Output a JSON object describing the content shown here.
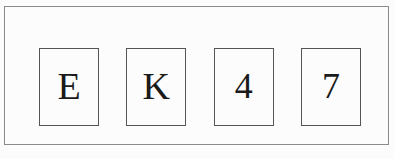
{
  "widget": {
    "name": "captcha-character-boxes",
    "background_color": "#fcfcfc",
    "frame_color": "#8a8a8a",
    "box_border_color": "#555555",
    "glyph_color": "#1a1a1a",
    "code": "EK47"
  },
  "characters": [
    {
      "value": "E",
      "kind": "letter"
    },
    {
      "value": "K",
      "kind": "letter"
    },
    {
      "value": "4",
      "kind": "digit"
    },
    {
      "value": "7",
      "kind": "digit"
    }
  ]
}
